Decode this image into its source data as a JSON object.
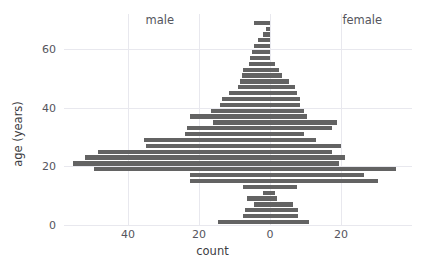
{
  "chart_data": {
    "type": "bar",
    "subtype": "population-pyramid",
    "title": "",
    "xlabel": "count",
    "ylabel": "age (years)",
    "xlim": [
      -58,
      40
    ],
    "ylim": [
      0,
      72
    ],
    "xtick_values": [
      -40,
      -20,
      0,
      20
    ],
    "xtick_labels": [
      "40",
      "20",
      "0",
      "20"
    ],
    "ytick_values": [
      0,
      20,
      40,
      60
    ],
    "ytick_labels": [
      "0",
      "20",
      "40",
      "60"
    ],
    "grid": true,
    "grid_axis": "both",
    "bar_color": "#636363",
    "grid_color": "#e8e8ee",
    "annotations": [
      {
        "text": "male",
        "x": -31,
        "y": 70
      },
      {
        "text": "female",
        "x": 26,
        "y": 70
      }
    ],
    "legend": "none",
    "bin_width": 2,
    "categories": [
      "0-2",
      "2-4",
      "4-6",
      "6-8",
      "8-10",
      "10-12",
      "12-14",
      "14-16",
      "16-18",
      "18-20",
      "20-22",
      "22-24",
      "24-26",
      "26-28",
      "28-30",
      "30-32",
      "32-34",
      "34-36",
      "36-38",
      "38-40",
      "40-42",
      "42-44",
      "44-46",
      "46-48",
      "48-50",
      "50-52",
      "52-54",
      "54-56",
      "56-58",
      "58-60",
      "60-62",
      "62-64",
      "64-66",
      "66-68",
      "68-70"
    ],
    "series": [
      {
        "name": "male",
        "side": "left",
        "values": [
          14.5,
          7.5,
          7.0,
          4.5,
          6.5,
          2.0,
          7.5,
          22.5,
          22.5,
          49.5,
          55.5,
          52.0,
          48.5,
          35.0,
          35.5,
          24.0,
          23.5,
          16.0,
          22.5,
          16.5,
          14.0,
          13.5,
          11.5,
          9.0,
          8.5,
          8.0,
          7.5,
          6.0,
          5.5,
          5.0,
          4.5,
          3.5,
          2.0,
          1.0,
          4.5
        ]
      },
      {
        "name": "female",
        "side": "right",
        "values": [
          11.0,
          8.0,
          8.0,
          6.5,
          2.0,
          1.5,
          7.5,
          30.5,
          26.5,
          35.5,
          19.5,
          21.0,
          17.5,
          20.0,
          13.0,
          9.5,
          17.5,
          19.0,
          10.5,
          9.5,
          8.5,
          8.5,
          7.5,
          7.0,
          5.5,
          3.5,
          2.5,
          1.5,
          0.0,
          0.0,
          0.0,
          0.0,
          0.0,
          0.0,
          0.0
        ]
      }
    ]
  }
}
